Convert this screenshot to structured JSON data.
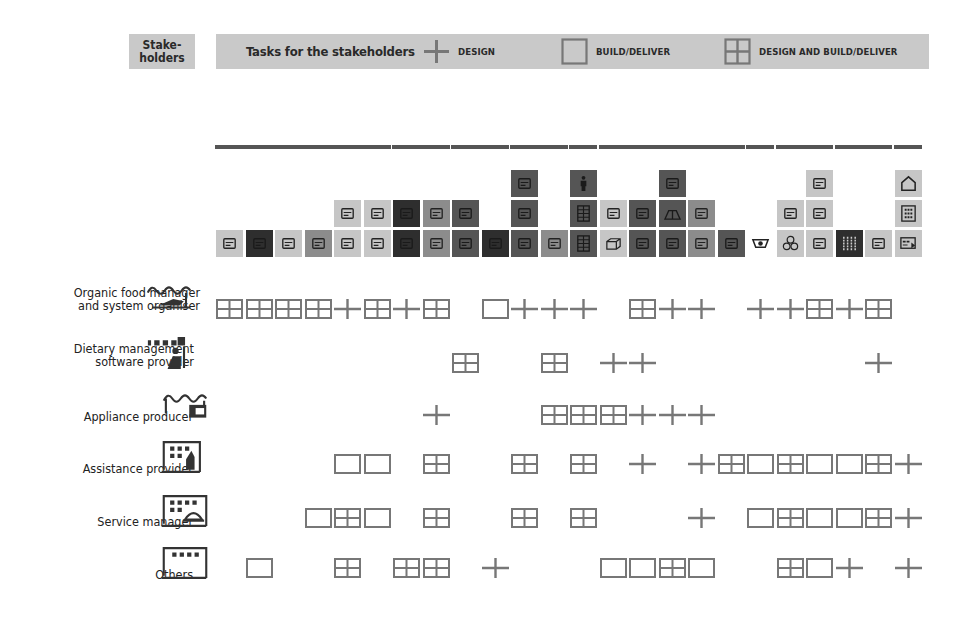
{
  "header": {
    "stakeholders_label": "Stake-\nholders",
    "tasks_title": "Tasks for the stakeholders",
    "legend": [
      {
        "symbol": "plus",
        "label": "DESIGN"
      },
      {
        "symbol": "box",
        "label": "BUILD/DELIVER"
      },
      {
        "symbol": "grid",
        "label": "DESIGN AND BUILD/DELIVER"
      }
    ]
  },
  "colors": {
    "header_bg": "#c9c9c9",
    "marker": "#777777",
    "tile_light": "#c6c6c6",
    "tile_mid": "#8c8c8c",
    "tile_dark": "#555555",
    "tile_vdark": "#2e2e2e",
    "groupbar": "#555555"
  },
  "task_groups": [
    {
      "start": 0,
      "end": 5
    },
    {
      "start": 6,
      "end": 7
    },
    {
      "start": 8,
      "end": 9
    },
    {
      "start": 10,
      "end": 11
    },
    {
      "start": 12,
      "end": 12
    },
    {
      "start": 13,
      "end": 17
    },
    {
      "start": 18,
      "end": 18
    },
    {
      "start": 19,
      "end": 20
    },
    {
      "start": 21,
      "end": 22
    },
    {
      "start": 23,
      "end": 23
    }
  ],
  "task_columns": [
    {
      "tiles": [
        {
          "shade": "light",
          "icon": "robot-arm-icon"
        }
      ]
    },
    {
      "tiles": [
        {
          "shade": "vdark",
          "icon": "screen-icon"
        }
      ]
    },
    {
      "tiles": [
        {
          "shade": "light",
          "icon": "vehicles-icon"
        }
      ]
    },
    {
      "tiles": [
        {
          "shade": "mid",
          "icon": "truck-icon"
        }
      ]
    },
    {
      "tiles": [
        {
          "shade": "light",
          "icon": "floorplan-icon"
        },
        {
          "shade": "light",
          "icon": "envelope-icon"
        }
      ]
    },
    {
      "tiles": [
        {
          "shade": "light",
          "icon": "bicycle-icon"
        },
        {
          "shade": "light",
          "icon": "person-desk-icon"
        }
      ]
    },
    {
      "tiles": [
        {
          "shade": "vdark",
          "icon": "fridge-icon"
        },
        {
          "shade": "vdark",
          "icon": "basket-icon"
        }
      ]
    },
    {
      "tiles": [
        {
          "shade": "mid",
          "icon": "card-icon"
        },
        {
          "shade": "mid",
          "icon": "presenter-icon"
        }
      ]
    },
    {
      "tiles": [
        {
          "shade": "dark",
          "icon": "kitchen-icon"
        },
        {
          "shade": "dark",
          "icon": "group-icon"
        }
      ]
    },
    {
      "tiles": [
        {
          "shade": "vdark",
          "icon": "cup-icon"
        }
      ]
    },
    {
      "tiles": [
        {
          "shade": "dark",
          "icon": "packages-icon"
        },
        {
          "shade": "dark",
          "icon": "glasses-icon"
        },
        {
          "shade": "dark",
          "icon": "box-open-icon"
        }
      ]
    },
    {
      "tiles": [
        {
          "shade": "mid",
          "icon": "cabinet-icon"
        }
      ]
    },
    {
      "tiles": [
        {
          "shade": "dark",
          "icon": "shelves-icon"
        },
        {
          "shade": "dark",
          "icon": "shelves-icon"
        },
        {
          "shade": "dark",
          "icon": "person-icon"
        }
      ]
    },
    {
      "tiles": [
        {
          "shade": "light",
          "icon": "cube-icon"
        },
        {
          "shade": "light",
          "icon": "cabinet-small-icon"
        }
      ]
    },
    {
      "tiles": [
        {
          "shade": "dark",
          "icon": "plate-icon"
        },
        {
          "shade": "dark",
          "icon": "pot-icon"
        }
      ]
    },
    {
      "tiles": [
        {
          "shade": "dark",
          "icon": "tray-icon"
        },
        {
          "shade": "dark",
          "icon": "tent-icon"
        },
        {
          "shade": "dark",
          "icon": "tag-icon"
        }
      ]
    },
    {
      "tiles": [
        {
          "shade": "mid",
          "icon": "tent-open-icon"
        },
        {
          "shade": "mid",
          "icon": "animal-icon"
        }
      ]
    },
    {
      "tiles": [
        {
          "shade": "dark",
          "icon": "hands-icon"
        }
      ]
    },
    {
      "tiles": [
        {
          "shade": "none",
          "icon": "washbasin-icon"
        }
      ]
    },
    {
      "tiles": [
        {
          "shade": "light",
          "icon": "coins-icon"
        },
        {
          "shade": "light",
          "icon": "soap-icon"
        }
      ]
    },
    {
      "tiles": [
        {
          "shade": "light",
          "icon": "coin-box-icon"
        },
        {
          "shade": "light",
          "icon": "coin-box-icon"
        },
        {
          "shade": "light",
          "icon": "coin-card-icon"
        }
      ]
    },
    {
      "tiles": [
        {
          "shade": "vdark",
          "icon": "grid-panel-icon"
        }
      ]
    },
    {
      "tiles": [
        {
          "shade": "light",
          "icon": "device-icon"
        }
      ]
    },
    {
      "tiles": [
        {
          "shade": "light",
          "icon": "dashboard-icon"
        },
        {
          "shade": "light",
          "icon": "keypad-icon"
        },
        {
          "shade": "light",
          "icon": "house-icon"
        }
      ]
    }
  ],
  "stakeholders": [
    {
      "name": "Organic food manager\nand system organiser",
      "icon": "boat-factory-icon",
      "tasks": [
        "G",
        "G",
        "G",
        "G",
        "P",
        "G",
        "P",
        "G",
        "",
        "B",
        "P",
        "P",
        "P",
        "",
        "G",
        "P",
        "P",
        "",
        "P",
        "P",
        "G",
        "P",
        "G",
        ""
      ]
    },
    {
      "name": "Dietary management\nsoftware provider",
      "icon": "office-worker-icon",
      "tasks": [
        "",
        "",
        "",
        "",
        "",
        "",
        "",
        "",
        "G",
        "",
        "",
        "G",
        "",
        "P",
        "P",
        "",
        "",
        "",
        "",
        "",
        "",
        "",
        "P",
        ""
      ]
    },
    {
      "name": "Appliance producer",
      "icon": "appliance-factory-icon",
      "tasks": [
        "",
        "",
        "",
        "",
        "",
        "",
        "",
        "P",
        "",
        "",
        "",
        "G",
        "G",
        "G",
        "P",
        "P",
        "P",
        "",
        "",
        "",
        "",
        "",
        "",
        ""
      ]
    },
    {
      "name": "Assistance provider",
      "icon": "assistance-building-icon",
      "tasks": [
        "",
        "",
        "",
        "",
        "B",
        "B",
        "",
        "G",
        "",
        "",
        "G",
        "",
        "G",
        "",
        "P",
        "",
        "P",
        "G",
        "B",
        "G",
        "B",
        "B",
        "G",
        "P"
      ]
    },
    {
      "name": "Service manager",
      "icon": "service-building-icon",
      "tasks": [
        "",
        "",
        "",
        "B",
        "G",
        "B",
        "",
        "G",
        "",
        "",
        "G",
        "",
        "G",
        "",
        "",
        "",
        "P",
        "",
        "B",
        "G",
        "B",
        "B",
        "G",
        "P"
      ]
    },
    {
      "name": "Others",
      "icon": "generic-building-icon",
      "tasks": [
        "",
        "B",
        "",
        "",
        "G",
        "",
        "G",
        "G",
        "",
        "P",
        "",
        "",
        "",
        "B",
        "B",
        "G",
        "B",
        "",
        "",
        "G",
        "B",
        "P",
        "",
        "P"
      ]
    }
  ]
}
